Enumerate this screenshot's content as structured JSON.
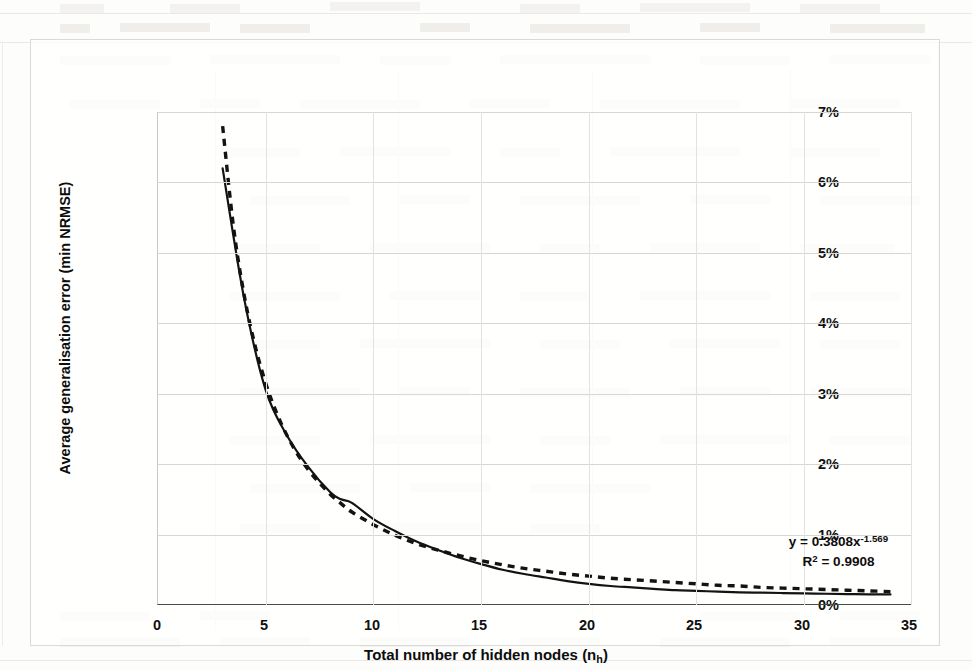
{
  "chart_data": {
    "type": "line",
    "title": "",
    "xlabel": "Total number of hidden nodes (n_h)",
    "ylabel": "Average generalisation error (min NRMSE)",
    "xlim": [
      0,
      35
    ],
    "ylim": [
      0,
      7
    ],
    "y_unit": "%",
    "grid": true,
    "legend": "none",
    "x_ticks": [
      "0",
      "5",
      "10",
      "15",
      "20",
      "25",
      "30",
      "35"
    ],
    "x_tick_values": [
      0,
      5,
      10,
      15,
      20,
      25,
      30,
      35
    ],
    "y_ticks": [
      "0%",
      "1%",
      "2%",
      "3%",
      "4%",
      "5%",
      "6%",
      "7%"
    ],
    "y_tick_values": [
      0,
      1,
      2,
      3,
      4,
      5,
      6,
      7
    ],
    "series": [
      {
        "name": "Average generalisation error",
        "style": "solid",
        "color": "#131313",
        "x": [
          3,
          4,
          5,
          6,
          7,
          8,
          8.5,
          9,
          10,
          11,
          12,
          13,
          14,
          15,
          16,
          17,
          18,
          19,
          20,
          21,
          22,
          23,
          24,
          25,
          26,
          27,
          28,
          29,
          30,
          31,
          32,
          33,
          34
        ],
        "values": [
          6.2,
          4.35,
          3.05,
          2.4,
          1.95,
          1.6,
          1.5,
          1.45,
          1.22,
          1.05,
          0.9,
          0.78,
          0.67,
          0.58,
          0.5,
          0.44,
          0.39,
          0.34,
          0.3,
          0.27,
          0.25,
          0.23,
          0.21,
          0.2,
          0.19,
          0.18,
          0.175,
          0.17,
          0.165,
          0.16,
          0.155,
          0.15,
          0.15
        ]
      },
      {
        "name": "Power trendline",
        "style": "dashed",
        "color": "#131313",
        "x": [
          3,
          3.5,
          4,
          4.5,
          5,
          5.5,
          6,
          6.5,
          7,
          7.5,
          8,
          8.5,
          9,
          10,
          11,
          12,
          13,
          14,
          15,
          16,
          17,
          18,
          19,
          20,
          21,
          22,
          23,
          24,
          25,
          26,
          27,
          28,
          29,
          30,
          31,
          32,
          33,
          34
        ],
        "values": [
          6.8,
          5.38,
          4.4,
          3.69,
          3.15,
          2.73,
          2.4,
          2.13,
          1.91,
          1.73,
          1.57,
          1.44,
          1.32,
          1.14,
          0.99,
          0.87,
          0.78,
          0.7,
          0.63,
          0.57,
          0.52,
          0.48,
          0.44,
          0.41,
          0.38,
          0.36,
          0.34,
          0.32,
          0.3,
          0.28,
          0.27,
          0.25,
          0.24,
          0.23,
          0.22,
          0.21,
          0.2,
          0.19
        ]
      }
    ],
    "annotations": {
      "equation": "y = 0.3808x",
      "equation_exponent": "-1.569",
      "r_squared_label": "R",
      "r_squared_sup": "2",
      "r_squared_value": " = 0.9908"
    }
  },
  "axes": {
    "y_title": "Average generalisation error (min NRMSE)",
    "x_title_main": "Total number of hidden nodes (n",
    "x_title_sub": "h",
    "x_title_end": ")"
  },
  "colors": {
    "series": "#131313",
    "grid": "#d9d7d3",
    "axis": "#4a4a48",
    "text": "#0d0d0d",
    "page_background": "#fdfdfc"
  }
}
